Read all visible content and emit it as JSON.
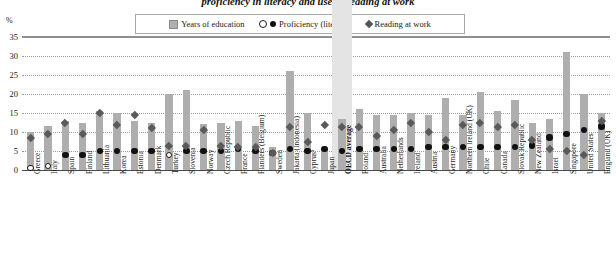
{
  "title": "proficiency in literacy and use of reading at work",
  "axis": {
    "unit": "%",
    "yticks": [
      "35",
      "30",
      "25",
      "20",
      "15",
      "10",
      "5",
      "0"
    ]
  },
  "legend": [
    {
      "label": "Years of education",
      "marker": "gray-square"
    },
    {
      "label": "Proficiency (literacy)",
      "marker": "open-and-filled-circle"
    },
    {
      "label": "Reading at work",
      "marker": "filled-diamond"
    }
  ],
  "chart_data": {
    "type": "bar",
    "title": "proficiency in literacy and use of reading at work",
    "xlabel": "",
    "ylabel": "%",
    "ylim": [
      0,
      35
    ],
    "grid": true,
    "legend_position": "top-center",
    "categories": [
      "Greece",
      "Italy",
      "Spain",
      "Finland",
      "Lithuania",
      "Korea",
      "Estonia",
      "Denmark",
      "Turkey",
      "Slovenia",
      "Norway",
      "Czech Republic",
      "France",
      "Flanders (Belgium)",
      "Sweden",
      "Jakarta (Indonesia)",
      "Cyprus¹",
      "Japan",
      "OECD average",
      "Poland",
      "Australia",
      "Netherlands",
      "Ireland",
      "Austria",
      "Germany",
      "Northern Ireland (UK)",
      "Chile",
      "Canada",
      "Slovak Republic",
      "New Zealand",
      "Israel",
      "Singapore",
      "United States",
      "England (UK)"
    ],
    "highlight_category": "OECD average",
    "series": [
      {
        "name": "Years of education",
        "type": "bar",
        "values": [
          10.0,
          11.5,
          13.0,
          12.5,
          15.5,
          15.0,
          13.0,
          12.5,
          20.0,
          21.0,
          12.0,
          12.5,
          13.0,
          11.5,
          6.0,
          26.0,
          15.0,
          5.5,
          13.5,
          16.0,
          14.5,
          14.5,
          15.0,
          14.5,
          19.0,
          14.5,
          20.5,
          15.5,
          18.5,
          12.5,
          13.5,
          31.0,
          20.0,
          15.0
        ]
      },
      {
        "name": "Proficiency (literacy)",
        "type": "scatter-circle",
        "values": [
          0.5,
          1.0,
          4.0,
          4.0,
          5.0,
          5.0,
          5.0,
          5.0,
          4.0,
          5.0,
          5.0,
          5.0,
          5.5,
          5.0,
          4.5,
          5.5,
          5.0,
          5.5,
          5.0,
          5.5,
          5.5,
          5.5,
          5.5,
          6.0,
          6.0,
          6.0,
          6.0,
          6.0,
          6.0,
          6.5,
          8.5,
          9.5,
          10.5,
          11.5
        ],
        "hollow_indices": [
          0,
          1,
          8
        ]
      },
      {
        "name": "Reading at work",
        "type": "scatter-diamond",
        "values": [
          8.5,
          9.5,
          12.5,
          9.5,
          15.0,
          12.0,
          14.5,
          11.0,
          6.5,
          6.5,
          10.5,
          6.5,
          6.0,
          6.0,
          4.5,
          11.5,
          7.5,
          12.0,
          11.5,
          11.5,
          9.0,
          10.5,
          12.5,
          10.0,
          8.0,
          12.0,
          12.5,
          11.5,
          12.0,
          8.0,
          5.5,
          5.0,
          4.0,
          13.0
        ]
      }
    ]
  }
}
